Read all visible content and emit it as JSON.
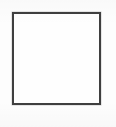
{
  "canvas": {
    "width_px": 116,
    "height_px": 127,
    "background_color": "#fdfdfd"
  },
  "square": {
    "shape": "empty-square-outline",
    "x_px": 12,
    "y_px": 12,
    "width_px": 89,
    "height_px": 93,
    "border_width_px": 2.5,
    "border_color": "#3f3f3f",
    "fill_color": "#fefefe"
  }
}
